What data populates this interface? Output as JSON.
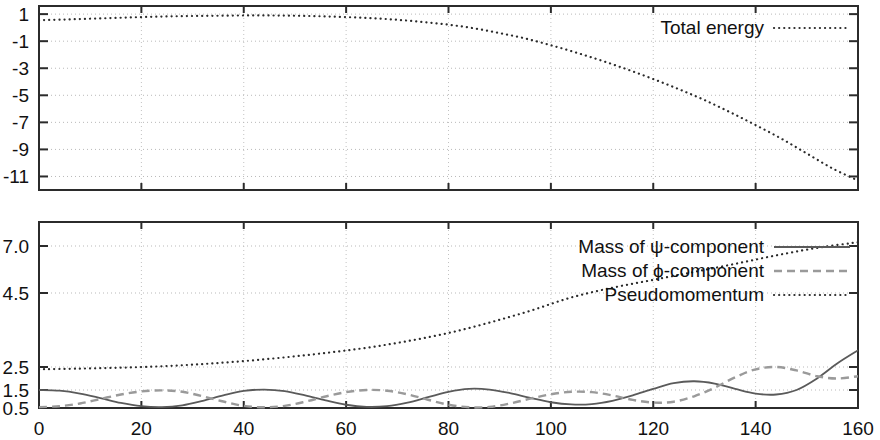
{
  "chart_data": [
    {
      "type": "line",
      "title": "",
      "panel": "top",
      "xlabel": "",
      "ylabel": "",
      "xlim": [
        0,
        160
      ],
      "ylim": [
        -12,
        1.6
      ],
      "xticks": [
        0,
        20,
        40,
        60,
        80,
        100,
        120,
        140,
        160
      ],
      "xtick_labels": [
        "",
        "",
        "",
        "",
        "",
        "",
        "",
        "",
        ""
      ],
      "yticks": [
        1,
        -1,
        -3,
        -5,
        -7,
        -9,
        -11
      ],
      "ytick_labels": [
        "1",
        "-1",
        "-3",
        "-5",
        "-7",
        "-9",
        "-11"
      ],
      "grid": true,
      "legend_position": "top-right",
      "series": [
        {
          "name": "Total energy",
          "style": "dotted",
          "color": "#2a2a2a",
          "x": [
            0,
            5,
            10,
            15,
            20,
            25,
            30,
            35,
            40,
            45,
            50,
            55,
            60,
            65,
            70,
            75,
            80,
            85,
            90,
            95,
            100,
            105,
            110,
            115,
            120,
            125,
            130,
            135,
            140,
            145,
            150,
            155,
            160
          ],
          "values": [
            0.55,
            0.6,
            0.66,
            0.72,
            0.78,
            0.83,
            0.86,
            0.88,
            0.9,
            0.9,
            0.88,
            0.84,
            0.78,
            0.7,
            0.58,
            0.42,
            0.22,
            -0.05,
            -0.4,
            -0.8,
            -1.3,
            -1.85,
            -2.45,
            -3.1,
            -3.8,
            -4.55,
            -5.35,
            -6.25,
            -7.2,
            -8.2,
            -9.3,
            -10.4,
            -11.3
          ]
        }
      ]
    },
    {
      "type": "line",
      "title": "",
      "panel": "bottom",
      "xlabel": "",
      "ylabel": "",
      "xlim": [
        0,
        160
      ],
      "ylim": [
        0.3,
        7.6
      ],
      "xticks": [
        0,
        20,
        40,
        60,
        80,
        100,
        120,
        140,
        160
      ],
      "xtick_labels": [
        "0",
        "20",
        "40",
        "60",
        "80",
        "100",
        "120",
        "140",
        "160"
      ],
      "yticks": [
        0.5,
        1.5,
        2.5,
        4.5,
        7.0
      ],
      "ytick_labels": [
        "0.5",
        "1.5",
        "2.5",
        "4.5",
        "7.0"
      ],
      "grid": true,
      "legend_position": "top-right",
      "series": [
        {
          "name": "Mass of ψ-component",
          "style": "solid",
          "color": "#5a5a5a",
          "x": [
            0,
            4,
            8,
            12,
            16,
            20,
            24,
            28,
            32,
            36,
            40,
            44,
            48,
            52,
            56,
            60,
            64,
            68,
            72,
            76,
            80,
            84,
            88,
            92,
            96,
            100,
            104,
            108,
            112,
            116,
            120,
            124,
            128,
            132,
            136,
            140,
            144,
            148,
            152,
            156,
            160
          ],
          "values": [
            1.5,
            1.46,
            1.3,
            1.05,
            0.78,
            0.6,
            0.55,
            0.65,
            0.9,
            1.2,
            1.45,
            1.52,
            1.44,
            1.2,
            0.92,
            0.68,
            0.56,
            0.6,
            0.8,
            1.1,
            1.4,
            1.55,
            1.52,
            1.33,
            1.06,
            0.82,
            0.7,
            0.72,
            0.9,
            1.2,
            1.55,
            1.8,
            1.88,
            1.78,
            1.55,
            1.3,
            1.25,
            1.5,
            2.0,
            2.6,
            2.95
          ]
        },
        {
          "name": "Mass of ϕ-component",
          "style": "dashed",
          "color": "#9a9a9a",
          "x": [
            0,
            4,
            8,
            12,
            16,
            20,
            24,
            28,
            32,
            36,
            40,
            44,
            48,
            52,
            56,
            60,
            64,
            68,
            72,
            76,
            80,
            84,
            88,
            92,
            96,
            100,
            104,
            108,
            112,
            116,
            120,
            124,
            128,
            132,
            136,
            140,
            144,
            148,
            152,
            156,
            160
          ],
          "values": [
            0.55,
            0.6,
            0.75,
            1.0,
            1.25,
            1.42,
            1.48,
            1.4,
            1.15,
            0.86,
            0.62,
            0.54,
            0.62,
            0.85,
            1.14,
            1.38,
            1.5,
            1.46,
            1.26,
            0.96,
            0.68,
            0.54,
            0.56,
            0.75,
            1.02,
            1.26,
            1.4,
            1.38,
            1.2,
            0.95,
            0.8,
            0.85,
            1.15,
            1.6,
            2.05,
            2.4,
            2.5,
            2.35,
            2.1,
            2.0,
            2.1
          ]
        },
        {
          "name": "Pseudomomentum",
          "style": "dotted",
          "color": "#2a2a2a",
          "x": [
            0,
            8,
            16,
            24,
            32,
            40,
            48,
            56,
            64,
            72,
            80,
            88,
            96,
            104,
            112,
            120,
            128,
            136,
            144,
            152,
            160
          ],
          "values": [
            2.4,
            2.43,
            2.47,
            2.52,
            2.58,
            2.66,
            2.76,
            2.88,
            3.02,
            3.2,
            3.42,
            3.7,
            4.02,
            4.38,
            4.78,
            5.2,
            5.62,
            6.05,
            6.5,
            6.9,
            7.2
          ]
        }
      ]
    }
  ],
  "legend": {
    "top": [
      {
        "label": "Total energy",
        "style": "dotted"
      }
    ],
    "bottom": [
      {
        "label": "Mass of ψ-component",
        "style": "solid"
      },
      {
        "label": "Mass of ϕ-component",
        "style": "dashed"
      },
      {
        "label": "Pseudomomentum",
        "style": "dotted"
      }
    ]
  }
}
